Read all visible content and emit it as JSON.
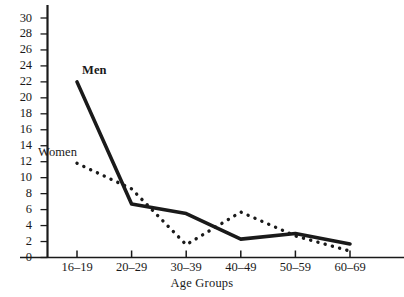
{
  "chart_data": {
    "type": "line",
    "title": "",
    "subtitle": "",
    "xlabel": "Age Groups",
    "ylabel": "",
    "categories": [
      "16–19",
      "20–29",
      "30–39",
      "40–49",
      "50–59",
      "60–69"
    ],
    "xlim": [
      0,
      5
    ],
    "ylim": [
      0,
      31
    ],
    "ytick_labels": [
      "0",
      "2",
      "4",
      "6",
      "8",
      "10",
      "12",
      "14",
      "16",
      "18",
      "20",
      "22",
      "24",
      "26",
      "28",
      "30"
    ],
    "ytick_values": [
      0,
      2,
      4,
      6,
      8,
      10,
      12,
      14,
      16,
      18,
      20,
      22,
      24,
      26,
      28,
      30
    ],
    "grid": false,
    "legend_position": "inline-annotations",
    "series": [
      {
        "name": "Men",
        "style": "solid",
        "color": "#1a1a1a",
        "values": [
          22.0,
          6.7,
          5.5,
          2.3,
          3.0,
          1.7
        ]
      },
      {
        "name": "Women",
        "style": "dotted",
        "color": "#1a1a1a",
        "values": [
          11.8,
          8.6,
          1.6,
          5.7,
          2.7,
          0.8
        ]
      }
    ],
    "annotations": [
      {
        "text": "Men",
        "series": "Men"
      },
      {
        "text": "Women",
        "series": "Women"
      }
    ]
  },
  "axis": {
    "x_title": "Age Groups"
  }
}
